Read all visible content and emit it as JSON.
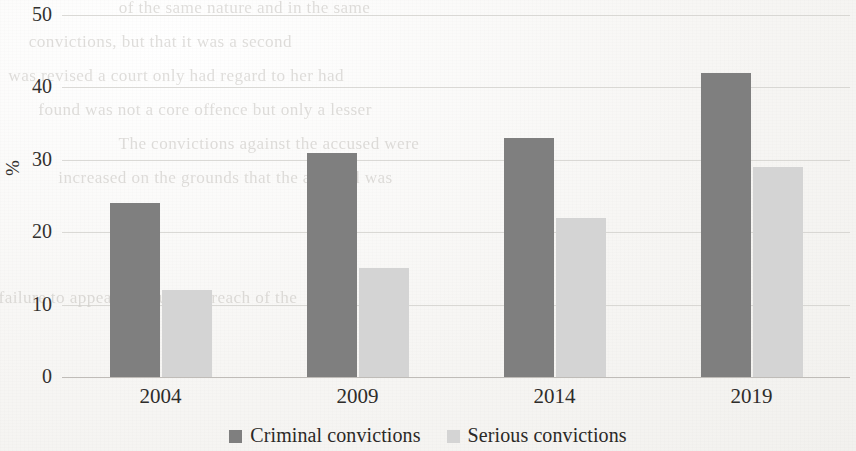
{
  "chart_data": {
    "type": "bar",
    "title": "",
    "subtitle": "",
    "xlabel": "",
    "ylabel": "%",
    "categories": [
      "2004",
      "2009",
      "2014",
      "2019"
    ],
    "series": [
      {
        "name": "Criminal convictions",
        "values": [
          24,
          31,
          33,
          42
        ],
        "color": "#7f7f7f"
      },
      {
        "name": "Serious convictions",
        "values": [
          12,
          15,
          22,
          29
        ],
        "color": "#d4d4d4"
      }
    ],
    "ylim": [
      0,
      50
    ],
    "ytick_labels": [
      "0",
      "10",
      "20",
      "30",
      "40",
      "50"
    ],
    "ytick_values": [
      0,
      10,
      20,
      30,
      40,
      50
    ],
    "grid": true,
    "legend_position": "bottom"
  },
  "legend": {
    "items": [
      {
        "label": "Criminal convictions",
        "color": "#7f7f7f"
      },
      {
        "label": "Serious convictions",
        "color": "#d4d4d4"
      }
    ]
  },
  "background_bleed": {
    "lines": [
      "of the same nature and in the same",
      "convictions, but that it was a second",
      "was revised a court only had regard to her had",
      "found was not a core offence but only a lesser",
      "The convictions against the accused were",
      "increased on the grounds that the accused was",
      "failure to appear in court in breach of the"
    ]
  }
}
